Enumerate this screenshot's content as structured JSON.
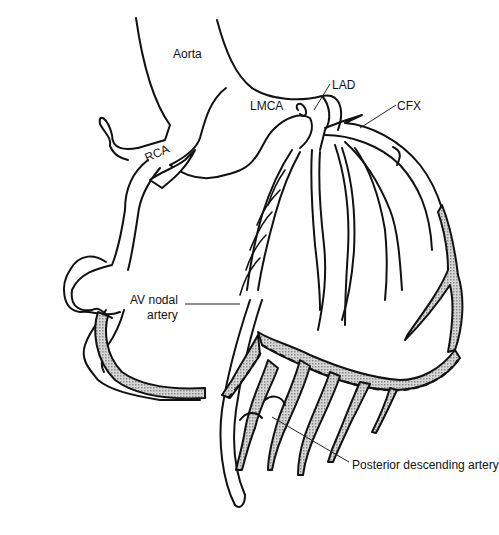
{
  "figure": {
    "labels": {
      "aorta": "Aorta",
      "lmca": "LMCA",
      "lad": "LAD",
      "cfx": "CFX",
      "rca": "RCA",
      "av_nodal_line1": "AV nodal",
      "av_nodal_line2": "artery",
      "pda": "Posterior descending artery"
    },
    "colors": {
      "line": "#111111",
      "shade": "#b8b8b8",
      "background": "#ffffff"
    }
  }
}
